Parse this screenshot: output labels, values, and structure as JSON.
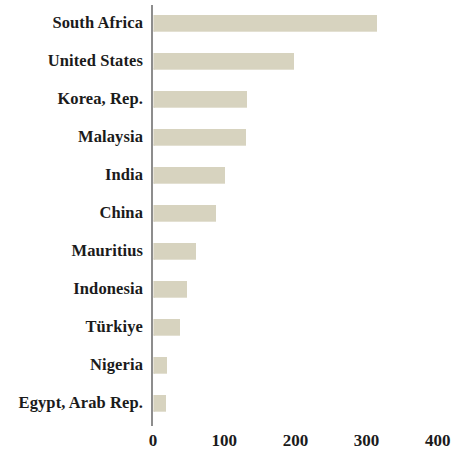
{
  "chart_data": {
    "type": "bar",
    "orientation": "horizontal",
    "title": "",
    "subtitle": "",
    "xlabel": "",
    "ylabel": "",
    "categories": [
      "South Africa",
      "United States",
      "Korea, Rep.",
      "Malaysia",
      "India",
      "China",
      "Mauritius",
      "Indonesia",
      "Türkiye",
      "Nigeria",
      "Egypt, Arab Rep."
    ],
    "values": [
      315,
      198,
      132,
      130,
      101,
      89,
      60,
      48,
      38,
      20,
      18
    ],
    "xticks": [
      0,
      100,
      200,
      300,
      400
    ],
    "xtick_labels": [
      "0",
      "100",
      "200",
      "300",
      "400"
    ],
    "xlim": [
      0,
      425
    ],
    "grid": false,
    "legend": null,
    "bar_color": "#d7d3bf",
    "axis_color": "#8d8d8d",
    "text_color": "#1b1b1b",
    "background_color": "#ffffff"
  }
}
